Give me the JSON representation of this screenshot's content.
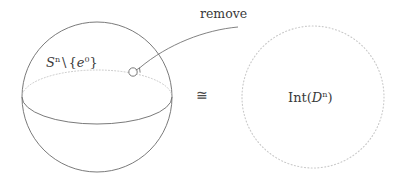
{
  "figure": {
    "background_color": "#ffffff",
    "stroke_color": "#6b6b6b",
    "dotted_color": "#b9b9b9",
    "text_color": "#3a3a3a"
  },
  "left_shape": {
    "name": "sphere",
    "label_prefix": "S",
    "label_prefix_sup": "n",
    "label_separator": "\\",
    "label_set_open": "{",
    "label_set_elem": "e",
    "label_set_elem_sup": "0",
    "label_set_close": "}",
    "label_plain": "S^n \\ {e^0}",
    "center_x": 97,
    "center_y": 97,
    "radius": 75
  },
  "removed_point": {
    "name": "removed-point-marker",
    "cx": 133,
    "cy": 72,
    "r": 4.2
  },
  "annotation": {
    "label": "remove",
    "arrow_from_x": 238,
    "arrow_from_y": 27,
    "arrow_to_x": 137,
    "arrow_to_y": 69
  },
  "relation": {
    "symbol": "≅",
    "meaning": "homeomorphic"
  },
  "right_shape": {
    "name": "open-disk",
    "label_prefix": "Int(",
    "label_mi": "D",
    "label_sup": "n",
    "label_suffix": ")",
    "label_plain": "Int(D^n)",
    "center_x": 313,
    "center_y": 97,
    "radius": 71,
    "border_style": "dotted"
  }
}
